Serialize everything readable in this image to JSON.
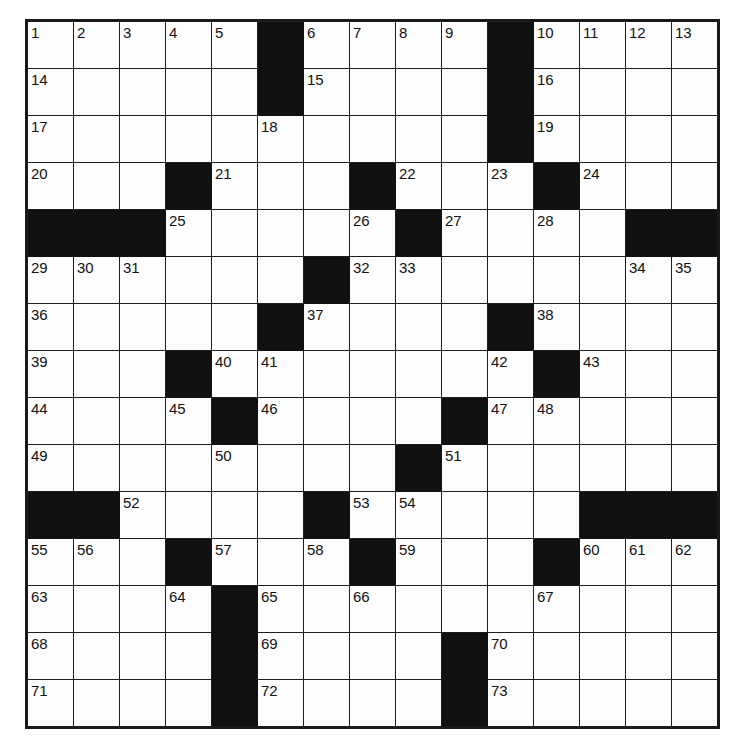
{
  "puzzle": {
    "title": "Crossword Puzzle Grid",
    "rows": 15,
    "cols": 15,
    "colors": {
      "block": "#111111",
      "cell": "#fdfdfd",
      "grid_line": "#1d1d1d",
      "outer_border": "#1a1a1a",
      "number_text": "#121212",
      "page_background": "#ffffff"
    },
    "max_clue_number": 73,
    "grid": [
      [
        {
          "n": "1"
        },
        {
          "n": "2"
        },
        {
          "n": "3"
        },
        {
          "n": "4"
        },
        {
          "n": "5"
        },
        {
          "block": true
        },
        {
          "n": "6"
        },
        {
          "n": "7"
        },
        {
          "n": "8"
        },
        {
          "n": "9"
        },
        {
          "block": true
        },
        {
          "n": "10"
        },
        {
          "n": "11"
        },
        {
          "n": "12"
        },
        {
          "n": "13"
        }
      ],
      [
        {
          "n": "14"
        },
        {},
        {},
        {},
        {},
        {
          "block": true
        },
        {
          "n": "15"
        },
        {},
        {},
        {},
        {
          "block": true
        },
        {
          "n": "16"
        },
        {},
        {},
        {}
      ],
      [
        {
          "n": "17"
        },
        {},
        {},
        {},
        {},
        {
          "n": "18"
        },
        {},
        {},
        {},
        {},
        {
          "block": true
        },
        {
          "n": "19"
        },
        {},
        {},
        {}
      ],
      [
        {
          "n": "20"
        },
        {},
        {},
        {
          "block": true
        },
        {
          "n": "21"
        },
        {},
        {},
        {
          "block": true
        },
        {
          "n": "22"
        },
        {},
        {
          "n": "23"
        },
        {
          "block": true
        },
        {
          "n": "24"
        },
        {},
        {}
      ],
      [
        {
          "block": true
        },
        {
          "block": true
        },
        {
          "block": true
        },
        {
          "n": "25"
        },
        {},
        {},
        {},
        {
          "n": "26"
        },
        {
          "block": true
        },
        {
          "n": "27"
        },
        {},
        {
          "n": "28"
        },
        {},
        {
          "block": true
        },
        {
          "block": true
        }
      ],
      [
        {
          "n": "29"
        },
        {
          "n": "30"
        },
        {
          "n": "31"
        },
        {},
        {},
        {},
        {
          "block": true
        },
        {
          "n": "32"
        },
        {
          "n": "33"
        },
        {},
        {},
        {},
        {},
        {
          "n": "34"
        },
        {
          "n": "35"
        }
      ],
      [
        {
          "n": "36"
        },
        {},
        {},
        {},
        {},
        {
          "block": true
        },
        {
          "n": "37"
        },
        {},
        {},
        {},
        {
          "block": true
        },
        {
          "n": "38"
        },
        {},
        {},
        {}
      ],
      [
        {
          "n": "39"
        },
        {},
        {},
        {
          "block": true
        },
        {
          "n": "40"
        },
        {
          "n": "41"
        },
        {},
        {},
        {},
        {},
        {
          "n": "42"
        },
        {
          "block": true
        },
        {
          "n": "43"
        },
        {},
        {}
      ],
      [
        {
          "n": "44"
        },
        {},
        {},
        {
          "n": "45"
        },
        {
          "block": true
        },
        {
          "n": "46"
        },
        {},
        {},
        {},
        {
          "block": true
        },
        {
          "n": "47"
        },
        {
          "n": "48"
        },
        {},
        {},
        {}
      ],
      [
        {
          "n": "49"
        },
        {},
        {},
        {},
        {
          "n": "50"
        },
        {},
        {},
        {},
        {
          "block": true
        },
        {
          "n": "51"
        },
        {},
        {},
        {},
        {},
        {}
      ],
      [
        {
          "block": true
        },
        {
          "block": true
        },
        {
          "n": "52"
        },
        {},
        {},
        {},
        {
          "block": true
        },
        {
          "n": "53"
        },
        {
          "n": "54"
        },
        {},
        {},
        {},
        {
          "block": true
        },
        {
          "block": true
        },
        {
          "block": true
        }
      ],
      [
        {
          "n": "55"
        },
        {
          "n": "56"
        },
        {},
        {
          "block": true
        },
        {
          "n": "57"
        },
        {},
        {
          "n": "58"
        },
        {
          "block": true
        },
        {
          "n": "59"
        },
        {},
        {},
        {
          "block": true
        },
        {
          "n": "60"
        },
        {
          "n": "61"
        },
        {
          "n": "62"
        }
      ],
      [
        {
          "n": "63"
        },
        {},
        {},
        {
          "n": "64"
        },
        {
          "block": true
        },
        {
          "n": "65"
        },
        {},
        {
          "n": "66"
        },
        {},
        {},
        {},
        {
          "n": "67"
        },
        {},
        {},
        {}
      ],
      [
        {
          "n": "68"
        },
        {},
        {},
        {},
        {
          "block": true
        },
        {
          "n": "69"
        },
        {},
        {},
        {},
        {
          "block": true
        },
        {
          "n": "70"
        },
        {},
        {},
        {},
        {}
      ],
      [
        {
          "n": "71"
        },
        {},
        {},
        {},
        {
          "block": true
        },
        {
          "n": "72"
        },
        {},
        {},
        {},
        {
          "block": true
        },
        {
          "n": "73"
        },
        {},
        {},
        {},
        {}
      ]
    ]
  }
}
